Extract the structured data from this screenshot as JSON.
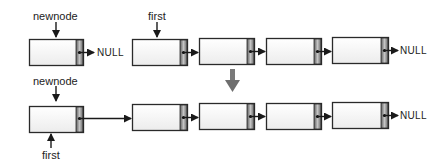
{
  "diagram": {
    "type": "linked-list-insert-at-front",
    "colors": {
      "node_fill": "#f4f4f4",
      "node_border": "#2a2a2a",
      "pointer_cell_dark": "#6b6b6b",
      "pointer_cell_light": "#bdbdbd",
      "arrow": "#1a1a1a",
      "transition_arrow": "#6e6e6e"
    },
    "before": {
      "newnode_label": "newnode",
      "newnode_next": "NULL",
      "first_label": "first",
      "list_length": 4,
      "list_tail_next": "NULL"
    },
    "after": {
      "newnode_label": "newnode",
      "first_label": "first",
      "list_length": 4,
      "list_tail_next": "NULL"
    }
  }
}
